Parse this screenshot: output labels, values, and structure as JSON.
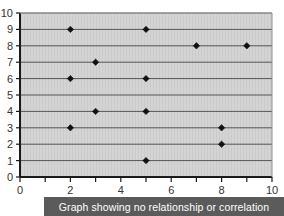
{
  "caption": {
    "text": "Graph showing no relationship or correlation"
  },
  "colors": {
    "plot_background": "#d4d4d4",
    "gridline": "#555555",
    "axis_line": "#1a1a1a",
    "marker": "#111111",
    "caption_background": "#5b5b5b",
    "caption_text": "#ffffff",
    "page_background": "#ffffff",
    "tick_text": "#333333"
  },
  "chart_data": {
    "type": "scatter",
    "title": "Graph showing no relationship or correlation",
    "xlabel": "",
    "ylabel": "",
    "xlim": [
      0,
      10
    ],
    "ylim": [
      0,
      10
    ],
    "grid": true,
    "grid_axis": "y",
    "legend": false,
    "marker_shape": "diamond",
    "x_ticks": [
      0,
      1,
      2,
      3,
      4,
      5,
      6,
      7,
      8,
      9,
      10
    ],
    "x_tick_labels": [
      "0",
      "",
      "2",
      "",
      "4",
      "",
      "6",
      "",
      "8",
      "",
      "10"
    ],
    "y_ticks": [
      0,
      1,
      2,
      3,
      4,
      5,
      6,
      7,
      8,
      9,
      10
    ],
    "y_tick_labels": [
      "0",
      "1",
      "2",
      "3",
      "4",
      "5",
      "6",
      "7",
      "8",
      "9",
      "10"
    ],
    "points": [
      {
        "x": 2,
        "y": 9
      },
      {
        "x": 5,
        "y": 9
      },
      {
        "x": 7,
        "y": 8
      },
      {
        "x": 9,
        "y": 8
      },
      {
        "x": 3,
        "y": 7
      },
      {
        "x": 2,
        "y": 6
      },
      {
        "x": 5,
        "y": 6
      },
      {
        "x": 3,
        "y": 4
      },
      {
        "x": 5,
        "y": 4
      },
      {
        "x": 2,
        "y": 3
      },
      {
        "x": 8,
        "y": 3
      },
      {
        "x": 8,
        "y": 2
      },
      {
        "x": 5,
        "y": 1
      }
    ]
  }
}
